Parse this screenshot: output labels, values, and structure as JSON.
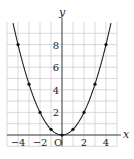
{
  "chart_data": {
    "type": "line",
    "title": "",
    "xlabel": "x",
    "ylabel": "y",
    "origin_label": "O",
    "xlim": [
      -5,
      5
    ],
    "ylim": [
      -1,
      10
    ],
    "grid": true,
    "x_ticks": [
      -4,
      -2,
      2,
      4
    ],
    "x_tick_labels": [
      "−4",
      "−2",
      "2",
      "4"
    ],
    "y_ticks": [
      2,
      4,
      6,
      8
    ],
    "y_tick_labels": [
      "2",
      "4",
      "6",
      "8"
    ],
    "function": "y = x^2 / 2",
    "points": [
      {
        "x": -4,
        "y": 8
      },
      {
        "x": -3,
        "y": 4.5
      },
      {
        "x": -2,
        "y": 2
      },
      {
        "x": -1,
        "y": 0.5
      },
      {
        "x": 0,
        "y": 0
      },
      {
        "x": 1,
        "y": 0.5
      },
      {
        "x": 2,
        "y": 2
      },
      {
        "x": 3,
        "y": 4.5
      },
      {
        "x": 4,
        "y": 8
      }
    ],
    "colors": {
      "curve": "#222222",
      "grid": "#c8c8c8",
      "axis": "#333333",
      "point": "#111111"
    }
  }
}
